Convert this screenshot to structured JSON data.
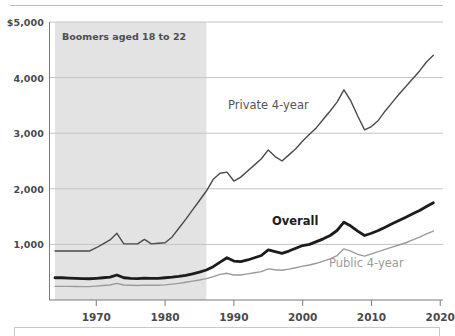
{
  "figure": {
    "band_label": "Boomers aged 18 to 22",
    "band_start_year": 1964,
    "band_end_year": 1986
  },
  "chart_data": {
    "type": "line",
    "title": "",
    "subtitle": "",
    "xlabel": "",
    "ylabel": "",
    "xlim": [
      1963,
      2020
    ],
    "ylim": [
      0,
      5000
    ],
    "grid": true,
    "legend_position": "inline-labels",
    "x_ticks": [
      1970,
      1980,
      1990,
      2000,
      2010,
      2020
    ],
    "x_tick_labels": [
      "1970",
      "1980",
      "1990",
      "2000",
      "2010",
      "2020"
    ],
    "y_ticks": [
      1000,
      2000,
      3000,
      4000,
      5000
    ],
    "y_tick_labels": [
      "1,000",
      "2,000",
      "3,000",
      "4,000",
      "$5,000"
    ],
    "annotations": [
      {
        "name": "shaded-band-label",
        "text": "Boomers aged 18 to 22",
        "x": 1965,
        "y": 4700
      },
      {
        "name": "private-series-label",
        "text": "Private 4-year",
        "x": 1991,
        "y": 3450
      },
      {
        "name": "overall-series-label",
        "text": "Overall",
        "x": 2000,
        "y": 1380
      },
      {
        "name": "public-series-label",
        "text": "Public 4-year",
        "x": 2009,
        "y": 700
      }
    ],
    "shaded_regions": [
      {
        "name": "boomers-band",
        "x_start": 1964,
        "x_end": 1986,
        "color": "#e3e3e3"
      }
    ],
    "x": [
      1964,
      1965,
      1966,
      1967,
      1968,
      1969,
      1970,
      1971,
      1972,
      1973,
      1974,
      1975,
      1976,
      1977,
      1978,
      1979,
      1980,
      1981,
      1982,
      1983,
      1984,
      1985,
      1986,
      1987,
      1988,
      1989,
      1990,
      1991,
      1992,
      1993,
      1994,
      1995,
      1996,
      1997,
      1998,
      1999,
      2000,
      2001,
      2002,
      2003,
      2004,
      2005,
      2006,
      2007,
      2008,
      2009,
      2010,
      2011,
      2012,
      2013,
      2014,
      2015,
      2016,
      2017,
      2018,
      2019
    ],
    "series": [
      {
        "name": "Private 4-year",
        "color": "#4a4a4a",
        "width": 1.4,
        "values": [
          880,
          880,
          880,
          880,
          880,
          880,
          940,
          1010,
          1080,
          1200,
          1010,
          1010,
          1010,
          1090,
          1010,
          1020,
          1030,
          1130,
          1290,
          1450,
          1620,
          1790,
          1960,
          2170,
          2280,
          2300,
          2140,
          2210,
          2320,
          2430,
          2540,
          2700,
          2580,
          2500,
          2610,
          2720,
          2860,
          2980,
          3100,
          3250,
          3400,
          3560,
          3780,
          3580,
          3310,
          3060,
          3120,
          3230,
          3400,
          3550,
          3700,
          3840,
          3980,
          4120,
          4280,
          4400
        ]
      },
      {
        "name": "Overall",
        "color": "#1c1c1c",
        "width": 2.8,
        "values": [
          400,
          400,
          395,
          390,
          385,
          382,
          390,
          400,
          410,
          450,
          400,
          390,
          385,
          395,
          390,
          390,
          400,
          410,
          425,
          445,
          470,
          500,
          540,
          600,
          680,
          760,
          700,
          690,
          720,
          760,
          800,
          900,
          870,
          840,
          880,
          930,
          980,
          1000,
          1050,
          1100,
          1160,
          1250,
          1400,
          1330,
          1240,
          1160,
          1200,
          1250,
          1310,
          1370,
          1430,
          1490,
          1550,
          1610,
          1680,
          1750
        ]
      },
      {
        "name": "Public 4-year",
        "color": "#9a9a9a",
        "width": 1.4,
        "values": [
          245,
          245,
          245,
          243,
          240,
          240,
          250,
          260,
          270,
          300,
          270,
          265,
          262,
          268,
          265,
          265,
          272,
          285,
          300,
          320,
          340,
          360,
          385,
          420,
          460,
          480,
          450,
          450,
          470,
          490,
          510,
          560,
          545,
          535,
          555,
          580,
          610,
          630,
          660,
          700,
          740,
          800,
          920,
          880,
          820,
          790,
          830,
          870,
          910,
          950,
          990,
          1030,
          1080,
          1130,
          1190,
          1240
        ]
      }
    ]
  }
}
